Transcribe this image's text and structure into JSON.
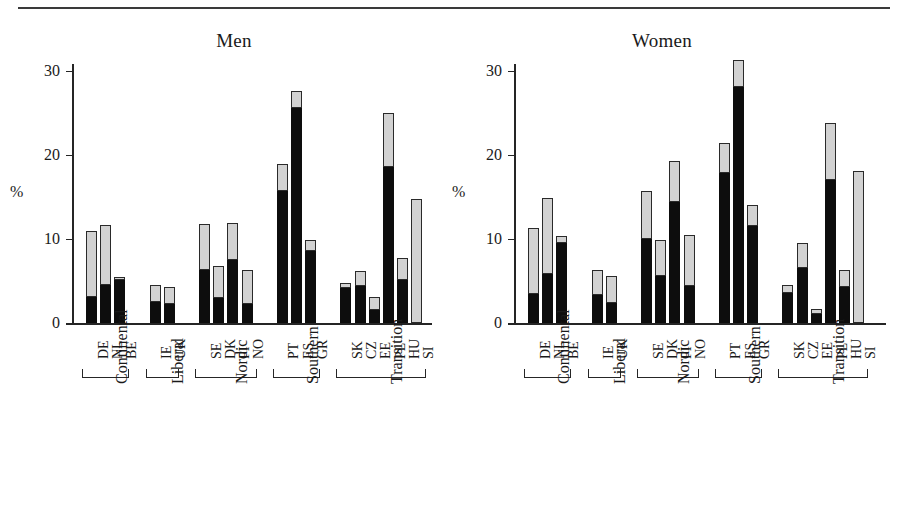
{
  "chart_data": {
    "type": "bar",
    "subtype": "stacked",
    "panels": [
      {
        "title": "Men",
        "ylabel": "%",
        "ylim": [
          0,
          32
        ],
        "yticks": [
          0,
          10,
          20,
          30
        ],
        "ytick_labels": [
          "0",
          "10",
          "20",
          "30"
        ],
        "grid": false,
        "legend": "none",
        "categories": [
          "DE",
          "NL",
          "BE",
          "IE",
          "UK",
          "SE",
          "DK",
          "FI",
          "NO",
          "PT",
          "ES",
          "GR",
          "SK",
          "CZ",
          "EE",
          "PL",
          "HU",
          "SI"
        ],
        "series": [
          {
            "name": "lower-segment-black",
            "color": "#0d0d0d",
            "values": [
              3.1,
              4.5,
              5.1,
              2.5,
              2.3,
              6.3,
              3.0,
              7.5,
              2.3,
              15.7,
              25.6,
              8.6,
              4.2,
              4.4,
              1.6,
              18.6,
              5.1,
              0.0
            ]
          },
          {
            "name": "upper-segment-grey",
            "color": "#d2d2d2",
            "values": [
              7.9,
              7.2,
              0.4,
              2.0,
              2.0,
              5.5,
              3.8,
              4.4,
              4.0,
              3.2,
              2.0,
              1.3,
              0.6,
              1.8,
              1.5,
              6.4,
              2.6,
              14.8
            ]
          }
        ],
        "totals": [
          11.0,
          11.7,
          5.5,
          4.5,
          4.3,
          11.8,
          6.8,
          11.9,
          6.3,
          18.9,
          27.6,
          9.9,
          4.8,
          6.2,
          3.1,
          25.0,
          7.7,
          14.8
        ],
        "groups": [
          {
            "label": "Continental",
            "members": [
              "DE",
              "NL",
              "BE"
            ]
          },
          {
            "label": "Liberal",
            "members": [
              "IE",
              "UK"
            ]
          },
          {
            "label": "Nordic",
            "members": [
              "SE",
              "DK",
              "FI",
              "NO"
            ]
          },
          {
            "label": "Southern",
            "members": [
              "PT",
              "ES",
              "GR"
            ]
          },
          {
            "label": "Transition",
            "members": [
              "SK",
              "CZ",
              "EE",
              "PL",
              "HU",
              "SI"
            ]
          }
        ]
      },
      {
        "title": "Women",
        "ylabel": "%",
        "ylim": [
          0,
          32
        ],
        "yticks": [
          0,
          10,
          20,
          30
        ],
        "ytick_labels": [
          "0",
          "10",
          "20",
          "30"
        ],
        "grid": false,
        "legend": "none",
        "categories": [
          "DE",
          "NL",
          "BE",
          "IE",
          "UK",
          "SE",
          "DK",
          "FI",
          "NO",
          "PT",
          "ES",
          "GR",
          "SK",
          "CZ",
          "EE",
          "PL",
          "HU",
          "SI"
        ],
        "series": [
          {
            "name": "lower-segment-black",
            "color": "#0d0d0d",
            "values": [
              3.4,
              5.8,
              9.5,
              3.3,
              2.4,
              10.0,
              5.6,
              14.4,
              4.4,
              17.9,
              28.1,
              11.5,
              3.6,
              6.6,
              1.1,
              17.0,
              4.3,
              0.0
            ]
          },
          {
            "name": "upper-segment-grey",
            "color": "#d2d2d2",
            "values": [
              7.9,
              9.1,
              0.8,
              3.0,
              3.2,
              5.7,
              4.3,
              4.9,
              6.1,
              3.5,
              3.2,
              2.5,
              0.9,
              2.9,
              0.6,
              6.8,
              2.0,
              18.1
            ]
          }
        ],
        "totals": [
          11.3,
          14.9,
          10.3,
          6.3,
          5.6,
          15.7,
          9.9,
          19.3,
          10.5,
          21.4,
          31.3,
          14.0,
          4.5,
          9.5,
          1.7,
          23.8,
          6.3,
          18.1
        ],
        "groups": [
          {
            "label": "Continental",
            "members": [
              "DE",
              "NL",
              "BE"
            ]
          },
          {
            "label": "Liberal",
            "members": [
              "IE",
              "UK"
            ]
          },
          {
            "label": "Nordic",
            "members": [
              "SE",
              "DK",
              "FI",
              "NO"
            ]
          },
          {
            "label": "Southern",
            "members": [
              "PT",
              "ES",
              "GR"
            ]
          },
          {
            "label": "Transition",
            "members": [
              "SK",
              "CZ",
              "EE",
              "PL",
              "HU",
              "SI"
            ]
          }
        ]
      }
    ]
  }
}
